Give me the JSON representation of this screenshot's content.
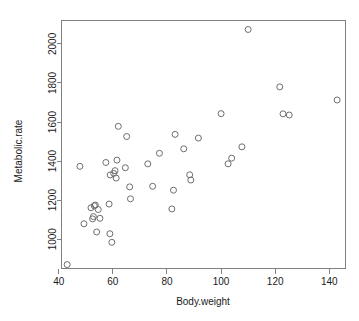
{
  "figure": {
    "title": "",
    "background_color": "#ffffff",
    "point_color": "#6e6e6e",
    "axis_color": "#808080",
    "text_color": "#1a1a1a"
  },
  "chart_data": {
    "type": "scatter",
    "title": "",
    "subtitle": "",
    "xlabel": "Body.weight",
    "ylabel": "Metabolic.rate",
    "xlim": [
      41.0,
      146.0
    ],
    "ylim": [
      850.0,
      2120.0
    ],
    "xticks": [
      40,
      60,
      80,
      100,
      120,
      140
    ],
    "xticklabels": [
      "40",
      "60",
      "80",
      "100",
      "120",
      "140"
    ],
    "yticks": [
      1000,
      1200,
      1400,
      1600,
      1800,
      2000
    ],
    "yticklabels": [
      "1000",
      "1200",
      "1400",
      "1600",
      "1800",
      "2000"
    ],
    "grid": false,
    "legend": null,
    "legend_position": "none",
    "marker": "open-circle",
    "marker_size": 3,
    "n_points": 44,
    "x": [
      43.1,
      47.8,
      49.3,
      51.9,
      52.5,
      52.8,
      53.1,
      53.5,
      54.0,
      54.6,
      55.2,
      57.4,
      58.6,
      58.9,
      59.0,
      59.6,
      60.3,
      60.8,
      61.2,
      61.5,
      62.0,
      64.6,
      65.1,
      66.2,
      66.5,
      72.9,
      74.7,
      77.2,
      81.8,
      82.4,
      83.0,
      86.2,
      88.4,
      88.8,
      91.6,
      100.0,
      102.6,
      103.9,
      107.7,
      110.0,
      121.7,
      122.9,
      125.2,
      142.9
    ],
    "y": [
      870,
      1373,
      1079,
      1161,
      1104,
      1116,
      1171,
      1175,
      1037,
      1152,
      1107,
      1393,
      1180,
      1028,
      1329,
      984,
      1337,
      1351,
      1313,
      1405,
      1578,
      1366,
      1526,
      1268,
      1207,
      1386,
      1271,
      1440,
      1155,
      1251,
      1537,
      1463,
      1330,
      1303,
      1518,
      1643,
      1386,
      1415,
      1473,
      2074,
      1780,
      1642,
      1636,
      1713
    ],
    "points": [
      {
        "x": 43.1,
        "y": 870
      },
      {
        "x": 47.8,
        "y": 1373
      },
      {
        "x": 49.3,
        "y": 1079
      },
      {
        "x": 51.9,
        "y": 1161
      },
      {
        "x": 52.5,
        "y": 1104
      },
      {
        "x": 52.8,
        "y": 1116
      },
      {
        "x": 53.1,
        "y": 1171
      },
      {
        "x": 53.5,
        "y": 1175
      },
      {
        "x": 54.0,
        "y": 1037
      },
      {
        "x": 54.6,
        "y": 1152
      },
      {
        "x": 55.2,
        "y": 1107
      },
      {
        "x": 57.4,
        "y": 1393
      },
      {
        "x": 58.6,
        "y": 1180
      },
      {
        "x": 58.9,
        "y": 1028
      },
      {
        "x": 59.0,
        "y": 1329
      },
      {
        "x": 59.6,
        "y": 984
      },
      {
        "x": 60.3,
        "y": 1337
      },
      {
        "x": 60.8,
        "y": 1351
      },
      {
        "x": 61.2,
        "y": 1313
      },
      {
        "x": 61.5,
        "y": 1405
      },
      {
        "x": 62.0,
        "y": 1578
      },
      {
        "x": 64.6,
        "y": 1366
      },
      {
        "x": 65.1,
        "y": 1526
      },
      {
        "x": 66.2,
        "y": 1268
      },
      {
        "x": 66.5,
        "y": 1207
      },
      {
        "x": 72.9,
        "y": 1386
      },
      {
        "x": 74.7,
        "y": 1271
      },
      {
        "x": 77.2,
        "y": 1440
      },
      {
        "x": 81.8,
        "y": 1155
      },
      {
        "x": 82.4,
        "y": 1251
      },
      {
        "x": 83.0,
        "y": 1537
      },
      {
        "x": 86.2,
        "y": 1463
      },
      {
        "x": 88.4,
        "y": 1330
      },
      {
        "x": 88.8,
        "y": 1303
      },
      {
        "x": 91.6,
        "y": 1518
      },
      {
        "x": 100.0,
        "y": 1643
      },
      {
        "x": 102.6,
        "y": 1386
      },
      {
        "x": 103.9,
        "y": 1415
      },
      {
        "x": 107.7,
        "y": 1473
      },
      {
        "x": 110.0,
        "y": 2074
      },
      {
        "x": 121.7,
        "y": 1780
      },
      {
        "x": 122.9,
        "y": 1642
      },
      {
        "x": 125.2,
        "y": 1636
      },
      {
        "x": 142.9,
        "y": 1713
      }
    ]
  }
}
